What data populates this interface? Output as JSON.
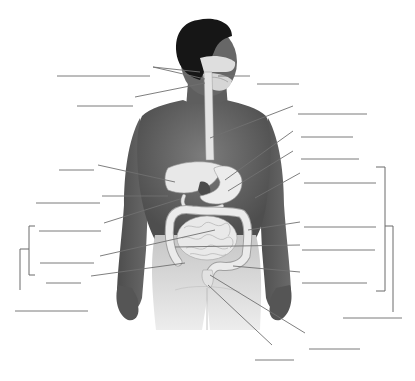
{
  "diagram": {
    "type": "unlabeled anatomy worksheet",
    "colors": {
      "background": "#ffffff",
      "skin": "#6e6e6e",
      "skin_dark": "#4a4a4a",
      "hair": "#161616",
      "organs": "#e6e6e6",
      "organ_outline": "#9a9a9a",
      "leader_line": "#707070",
      "blank_line": "#7a7a7a",
      "pants": "#d0d0d0"
    },
    "blank_label_lines": [
      {
        "id": "blank-1",
        "x1": 57,
        "y1": 76,
        "x2": 150,
        "y2": 76,
        "side": "left"
      },
      {
        "id": "blank-2",
        "x1": 77,
        "y1": 106,
        "x2": 133,
        "y2": 106,
        "side": "left"
      },
      {
        "id": "blank-3",
        "x1": 257,
        "y1": 84,
        "x2": 299,
        "y2": 84,
        "side": "right"
      },
      {
        "id": "blank-4",
        "x1": 298,
        "y1": 114,
        "x2": 367,
        "y2": 114,
        "side": "right"
      },
      {
        "id": "blank-5",
        "x1": 301,
        "y1": 137,
        "x2": 353,
        "y2": 137,
        "side": "right"
      },
      {
        "id": "blank-6",
        "x1": 301,
        "y1": 159,
        "x2": 359,
        "y2": 159,
        "side": "right"
      },
      {
        "id": "blank-7",
        "x1": 59,
        "y1": 170,
        "x2": 94,
        "y2": 170,
        "side": "left"
      },
      {
        "id": "blank-8",
        "x1": 304,
        "y1": 183,
        "x2": 376,
        "y2": 183,
        "side": "right"
      },
      {
        "id": "blank-9",
        "x1": 36,
        "y1": 203,
        "x2": 100,
        "y2": 203,
        "side": "left"
      },
      {
        "id": "blank-10",
        "x1": 304,
        "y1": 227,
        "x2": 376,
        "y2": 227,
        "side": "right"
      },
      {
        "id": "blank-11",
        "x1": 39,
        "y1": 231,
        "x2": 101,
        "y2": 231,
        "side": "left"
      },
      {
        "id": "blank-12",
        "x1": 302,
        "y1": 250,
        "x2": 375,
        "y2": 250,
        "side": "right"
      },
      {
        "id": "blank-13",
        "x1": 40,
        "y1": 263,
        "x2": 94,
        "y2": 263,
        "side": "left"
      },
      {
        "id": "blank-14",
        "x1": 46,
        "y1": 283,
        "x2": 81,
        "y2": 283,
        "side": "left"
      },
      {
        "id": "blank-15",
        "x1": 302,
        "y1": 283,
        "x2": 367,
        "y2": 283,
        "side": "right"
      },
      {
        "id": "blank-16",
        "x1": 15,
        "y1": 311,
        "x2": 88,
        "y2": 311,
        "side": "left"
      },
      {
        "id": "blank-17",
        "x1": 343,
        "y1": 318,
        "x2": 402,
        "y2": 318,
        "side": "right"
      },
      {
        "id": "blank-18",
        "x1": 309,
        "y1": 349,
        "x2": 360,
        "y2": 349,
        "side": "right"
      },
      {
        "id": "blank-19",
        "x1": 255,
        "y1": 360,
        "x2": 294,
        "y2": 360,
        "side": "bottom"
      }
    ],
    "leader_lines": [
      {
        "id": "leader-salivary-a",
        "x1": 153,
        "y1": 67,
        "x2": 200,
        "y2": 72
      },
      {
        "id": "leader-salivary-b",
        "x1": 153,
        "y1": 67,
        "x2": 205,
        "y2": 79
      },
      {
        "id": "leader-mouth",
        "x1": 218,
        "y1": 76,
        "x2": 250,
        "y2": 76
      },
      {
        "id": "leader-pharynx",
        "x1": 135,
        "y1": 97,
        "x2": 205,
        "y2": 83
      },
      {
        "id": "leader-esophagus",
        "x1": 293,
        "y1": 106,
        "x2": 210,
        "y2": 138
      },
      {
        "id": "leader-liver",
        "x1": 98,
        "y1": 165,
        "x2": 175,
        "y2": 182
      },
      {
        "id": "leader-stomach",
        "x1": 293,
        "y1": 131,
        "x2": 225,
        "y2": 180
      },
      {
        "id": "leader-pancreas",
        "x1": 293,
        "y1": 151,
        "x2": 228,
        "y2": 191
      },
      {
        "id": "leader-gallbladder",
        "x1": 102,
        "y1": 196,
        "x2": 168,
        "y2": 196
      },
      {
        "id": "leader-spleen",
        "x1": 300,
        "y1": 173,
        "x2": 255,
        "y2": 198
      },
      {
        "id": "leader-duodenum",
        "x1": 104,
        "y1": 223,
        "x2": 180,
        "y2": 199
      },
      {
        "id": "leader-transverse-colon",
        "x1": 300,
        "y1": 222,
        "x2": 248,
        "y2": 230
      },
      {
        "id": "leader-small-intestine",
        "x1": 100,
        "y1": 256,
        "x2": 215,
        "y2": 230
      },
      {
        "id": "leader-descending-colon",
        "x1": 300,
        "y1": 245,
        "x2": 175,
        "y2": 247
      },
      {
        "id": "leader-cecum",
        "x1": 91,
        "y1": 276,
        "x2": 185,
        "y2": 263
      },
      {
        "id": "leader-sigmoid-colon",
        "x1": 300,
        "y1": 272,
        "x2": 233,
        "y2": 266
      },
      {
        "id": "leader-rectum",
        "x1": 305,
        "y1": 333,
        "x2": 210,
        "y2": 275
      },
      {
        "id": "leader-anus",
        "x1": 272,
        "y1": 345,
        "x2": 208,
        "y2": 285
      }
    ],
    "brackets": [
      {
        "id": "bracket-right-inner",
        "x": 385,
        "y1": 167,
        "y2": 291,
        "tick_left": 376
      },
      {
        "id": "bracket-right-outer",
        "x": 393,
        "y1": 226,
        "y2": 312,
        "tick_left": 385
      },
      {
        "id": "bracket-left-inner",
        "x": 29,
        "y1": 226,
        "y2": 275,
        "tick_right": 35
      },
      {
        "id": "bracket-left-outer",
        "x": 20,
        "y1": 249,
        "y2": 290,
        "tick_right": 29
      }
    ]
  }
}
